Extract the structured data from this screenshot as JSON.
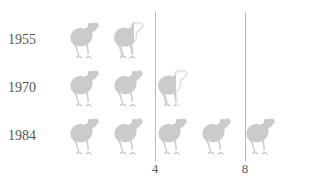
{
  "chart_data": {
    "type": "pictogram",
    "title": "",
    "subtitle": "",
    "xlabel": "",
    "ylabel": "",
    "icon": "chicken-icon",
    "icon_unit_value": 1,
    "grid": true,
    "legend_position": "none",
    "xlim": [
      0,
      10
    ],
    "axis_ticks": [
      {
        "value": 4,
        "label": "4"
      },
      {
        "value": 8,
        "label": "8"
      }
    ],
    "categories": [
      "1955",
      "1970",
      "1984"
    ],
    "values": [
      2.6,
      3.7,
      5.0
    ],
    "rows": [
      {
        "label": "1955",
        "value": 2.6,
        "full_icons": 1,
        "partial_icon_fraction": 0.55
      },
      {
        "label": "1970",
        "value": 3.7,
        "full_icons": 2,
        "partial_icon_fraction": 0.5
      },
      {
        "label": "1984",
        "value": 5.0,
        "full_icons": 5,
        "partial_icon_fraction": 0
      }
    ]
  },
  "colors": {
    "icon_fill": "#cbcbcb",
    "icon_ghost": "#f2f2f2",
    "gridline": "#b9b9b9",
    "text": "#555555",
    "axis_text": "#5a5a5a",
    "background": "#ffffff"
  },
  "axis": {
    "tick_4_label": "4",
    "tick_8_label": "8"
  },
  "rows": {
    "r0_label": "1955",
    "r1_label": "1970",
    "r2_label": "1984"
  }
}
